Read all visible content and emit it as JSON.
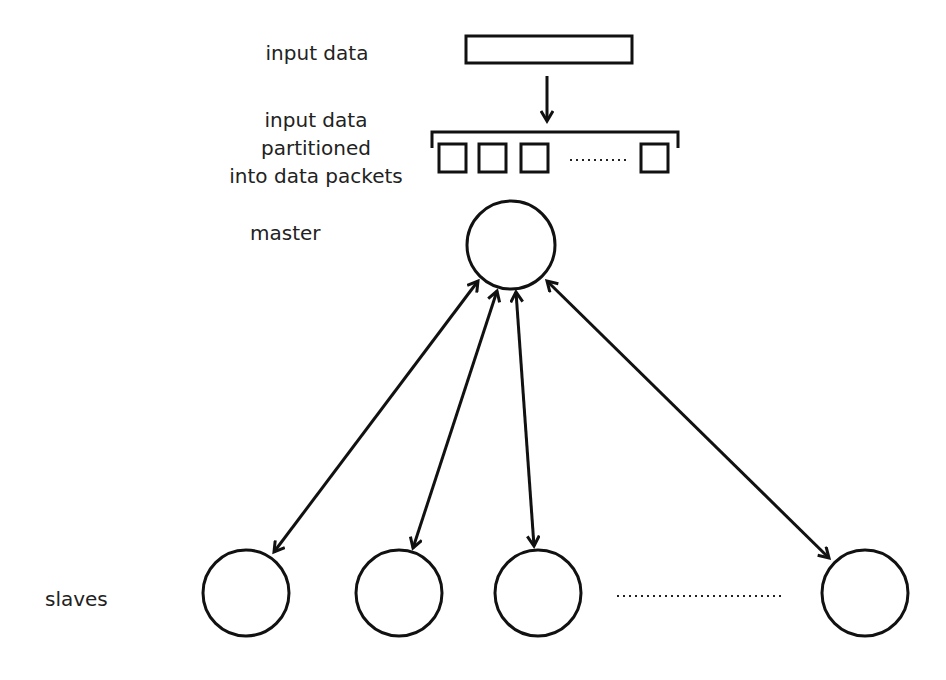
{
  "labels": {
    "input_data": "input data",
    "partitioned_line1": "input data",
    "partitioned_line2": "partitioned",
    "partitioned_line3": "into data packets",
    "master": "master",
    "slaves": "slaves"
  },
  "colors": {
    "stroke": "#111111",
    "text": "#222222",
    "background": "#ffffff"
  },
  "structure": {
    "input_block": "single rectangle",
    "packets_visible": 4,
    "packets_ellipsis": true,
    "master_nodes": 1,
    "slave_nodes_visible": 4,
    "slaves_ellipsis": true,
    "connections": "bidirectional arrows master <-> each slave"
  }
}
